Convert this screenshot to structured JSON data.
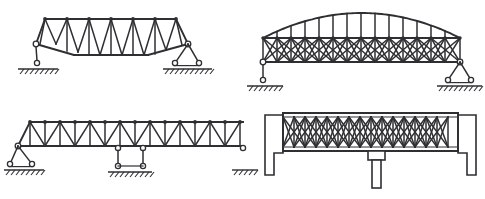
{
  "figure": {
    "background_color": "#ffffff",
    "line_color": "#2f2f33",
    "width": 485,
    "height": 199,
    "panel_count": 4
  },
  "panels": [
    {
      "id": "top-left",
      "name": "camelback-warren-truss",
      "description": "Camelback / polygonal top-chord Warren truss with verticals and sagging bottom chord",
      "support_left": "pin-rocker-single",
      "support_right": "rocker-two-roller",
      "web_pattern": "warren-with-verticals",
      "panels": 6,
      "geometry": {
        "top_chord": [
          [
            36,
            44
          ],
          [
            45,
            19
          ],
          [
            176,
            19
          ],
          [
            188,
            44
          ]
        ],
        "bottom_chord": [
          [
            36,
            44
          ],
          [
            74,
            55
          ],
          [
            148,
            55
          ],
          [
            188,
            44
          ]
        ],
        "inner_bottom": [
          [
            74,
            55
          ],
          [
            148,
            55
          ]
        ],
        "top_nodes_x": [
          45,
          67,
          89,
          111,
          133,
          155,
          176
        ],
        "top_y": 19,
        "verticals": [
          [
            [
              45,
              19
            ],
            [
              40,
              44
            ]
          ],
          [
            [
              67,
              19
            ],
            [
              67,
              51
            ]
          ],
          [
            [
              89,
              19
            ],
            [
              89,
              55
            ]
          ],
          [
            [
              111,
              19
            ],
            [
              111,
              55
            ]
          ],
          [
            [
              133,
              19
            ],
            [
              133,
              55
            ]
          ],
          [
            [
              155,
              19
            ],
            [
              155,
              54
            ]
          ],
          [
            [
              176,
              19
            ],
            [
              182,
              45
            ]
          ]
        ],
        "diagonals": [
          [
            [
              45,
              19
            ],
            [
              56,
              44
            ]
          ],
          [
            [
              56,
              44
            ],
            [
              67,
              19
            ]
          ],
          [
            [
              67,
              19
            ],
            [
              78,
              52
            ]
          ],
          [
            [
              78,
              52
            ],
            [
              89,
              19
            ]
          ],
          [
            [
              89,
              19
            ],
            [
              100,
              55
            ]
          ],
          [
            [
              100,
              55
            ],
            [
              111,
              19
            ]
          ],
          [
            [
              111,
              19
            ],
            [
              122,
              55
            ]
          ],
          [
            [
              122,
              55
            ],
            [
              133,
              19
            ]
          ],
          [
            [
              133,
              19
            ],
            [
              144,
              55
            ]
          ],
          [
            [
              144,
              55
            ],
            [
              155,
              19
            ]
          ],
          [
            [
              155,
              19
            ],
            [
              166,
              50
            ]
          ],
          [
            [
              166,
              50
            ],
            [
              176,
              19
            ]
          ]
        ],
        "supports": {
          "left": {
            "pin": [
              36,
              44
            ],
            "apex": [
              36,
              44
            ],
            "roller": [
              37,
              63
            ],
            "ground_y": 69,
            "ground_x1": 18,
            "ground_x2": 58
          },
          "right": {
            "pin": [
              188,
              44
            ],
            "rollers": [
              [
                175,
                63
              ],
              [
                199,
                63
              ]
            ],
            "ground_y": 69,
            "ground_x1": 163,
            "ground_x2": 212
          }
        }
      }
    },
    {
      "id": "top-right",
      "name": "lenticular-arch-lattice-truss",
      "description": "Bowstring / arched top chord lattice truss with X web bracing",
      "support_left": "pin-rocker-single",
      "support_right": "rocker-two-roller",
      "web_pattern": "double-intersection-lattice",
      "panels": 14,
      "geometry": {
        "arch_start": [
          263,
          38
        ],
        "arch_end": [
          460,
          38
        ],
        "arch_peak_y": 13,
        "straight_chord_y": 38,
        "bottom_chord_y": 62,
        "bottom_x1": 263,
        "bottom_x2": 460,
        "post_xs": [
          263,
          277,
          291,
          305,
          319,
          333,
          347,
          361,
          375,
          389,
          403,
          417,
          431,
          445,
          460
        ],
        "end_post_left": [
          [
            263,
            38
          ],
          [
            263,
            62
          ]
        ],
        "end_post_right": [
          [
            460,
            38
          ],
          [
            460,
            62
          ]
        ],
        "supports": {
          "left": {
            "pin": [
              263,
              62
            ],
            "roller": [
              263,
              80
            ],
            "ground_y": 86,
            "ground_x1": 247,
            "ground_x2": 283
          },
          "right": {
            "pin": [
              460,
              62
            ],
            "rollers": [
              [
                448,
                80
              ],
              [
                471,
                80
              ]
            ],
            "ground_y": 86,
            "ground_x1": 437,
            "ground_x2": 482
          }
        }
      }
    },
    {
      "id": "bottom-left",
      "name": "continuous-pratt-warren-deck-truss",
      "description": "Long parallel-chord truss with verticals and diagonals over two supports",
      "support_left": "rocker-two-roller",
      "support_mid": "pedestal-roller-pair",
      "support_right": "rocker-single",
      "web_pattern": "warren-with-verticals",
      "panels": 14,
      "geometry": {
        "top_chord_y": 122,
        "bottom_chord_y": 146,
        "x1": 30,
        "x2": 243,
        "start_slope": [
          [
            18,
            146
          ],
          [
            30,
            122
          ]
        ],
        "node_xs": [
          30,
          45,
          60,
          75,
          90,
          105,
          120,
          135,
          150,
          165,
          180,
          195,
          210,
          225,
          240
        ],
        "supports": {
          "left": {
            "pin": [
              18,
              146
            ],
            "rollers": [
              [
                10,
                164
              ],
              [
                32,
                164
              ]
            ],
            "ground_y": 170,
            "ground_x1": 4,
            "ground_x2": 44
          },
          "mid": {
            "pins": [
              [
                118,
                148
              ],
              [
                143,
                148
              ]
            ],
            "rollers": [
              [
                118,
                166
              ],
              [
                143,
                166
              ]
            ],
            "ground_y": 172,
            "ground_x1": 108,
            "ground_x2": 152
          },
          "right": {
            "pin": [
              243,
              148
            ],
            "ground_y": 170,
            "ground_x1": 232,
            "ground_x2": 258
          }
        }
      }
    },
    {
      "id": "bottom-right",
      "name": "lattice-girder-with-central-pier",
      "description": "Deep double-intersection lattice girder spanning between abutments with a central pier",
      "support_left": "abutment-wall",
      "support_mid": "central-pier-column",
      "support_right": "abutment-wall",
      "web_pattern": "double-intersection-lattice",
      "panels": 16,
      "geometry": {
        "girder_x1": 283,
        "girder_x2": 458,
        "top_y": 113,
        "bottom_y": 151,
        "post_spacing": 11,
        "left_abutment": {
          "x": 265,
          "y": 115,
          "w": 18,
          "h": 60,
          "notch_w": 9,
          "notch_h": 38
        },
        "right_abutment": {
          "x": 458,
          "y": 115,
          "w": 18,
          "h": 60,
          "notch_w": 9,
          "notch_h": 38
        },
        "pier": {
          "cap_x": 368,
          "cap_y": 151,
          "cap_w": 17,
          "cap_h": 9,
          "col_x": 372,
          "col_y": 160,
          "col_w": 9,
          "col_h": 28
        }
      }
    }
  ],
  "legend": {
    "symbols": [
      {
        "name": "pin-support",
        "glyph": "circle-on-ground"
      },
      {
        "name": "roller-support",
        "glyph": "circle-pair"
      },
      {
        "name": "fixed-ground",
        "glyph": "hatched-line"
      }
    ]
  }
}
